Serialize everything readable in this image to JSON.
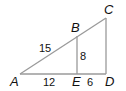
{
  "diagram": {
    "type": "similar-triangles",
    "colors": {
      "line": "#9a9a9a",
      "text": "#111111",
      "background": "#ffffff"
    },
    "vertices": {
      "A": {
        "label": "A",
        "x": 20,
        "y": 74
      },
      "B": {
        "label": "B",
        "x": 77,
        "y": 36
      },
      "C": {
        "label": "C",
        "x": 106,
        "y": 18
      },
      "D": {
        "label": "D",
        "x": 106,
        "y": 74
      },
      "E": {
        "label": "E",
        "x": 77,
        "y": 74
      }
    },
    "measures": {
      "AB": "15",
      "BE": "8",
      "AE": "12",
      "ED": "6"
    }
  }
}
